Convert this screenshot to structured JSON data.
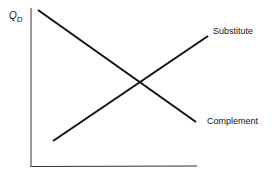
{
  "diagram": {
    "y_axis_label": "Q",
    "y_axis_subscript": "D",
    "lines": [
      {
        "name": "Substitute",
        "slope": "upward",
        "from": [
          53,
          141
        ],
        "to": [
          208,
          36
        ]
      },
      {
        "name": "Complement",
        "slope": "downward",
        "from": [
          38,
          10
        ],
        "to": [
          196,
          122
        ]
      }
    ],
    "labels": {
      "substitute": "Substitute",
      "complement": "Complement"
    },
    "line_color": "#111111"
  }
}
